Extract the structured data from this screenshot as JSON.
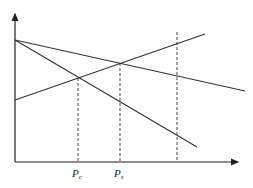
{
  "diagram": {
    "type": "economics-line-diagram",
    "axes": {
      "origin": [
        15,
        162
      ],
      "y_axis_top": [
        15,
        12
      ],
      "x_axis_right": [
        240,
        162
      ],
      "stroke": "#222222"
    },
    "lines": [
      {
        "name": "steep-downward-line",
        "from": [
          15,
          40
        ],
        "to": [
          197,
          147
        ]
      },
      {
        "name": "shallow-downward-line",
        "from": [
          15,
          40
        ],
        "to": [
          245,
          91
        ]
      },
      {
        "name": "upward-line",
        "from": [
          15,
          100
        ],
        "to": [
          205,
          34
        ]
      }
    ],
    "dashed_lines": [
      {
        "name": "pc-dashed-line",
        "x": 78,
        "y_top": 78
      },
      {
        "name": "ps-dashed-line",
        "x": 120,
        "y_top": 63
      },
      {
        "name": "right-dashed-line",
        "x": 177,
        "y_top": 32
      }
    ],
    "labels": {
      "pc": {
        "main": "P",
        "sub": "c",
        "x": 72,
        "y": 177
      },
      "ps": {
        "main": "P",
        "sub": "s",
        "x": 114,
        "y": 177
      }
    }
  }
}
